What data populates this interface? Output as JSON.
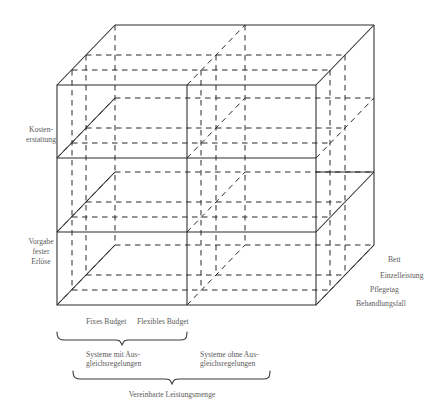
{
  "figure": {
    "type": "3d-cube-taxonomy-diagram",
    "language": "de"
  },
  "axes": {
    "vertical": {
      "name": "verguetungsprinzip",
      "labels": [
        {
          "id": "kostenerstattung",
          "line1": "Kosten-",
          "line2": "erstattung"
        },
        {
          "id": "vorgabe-fester-erloese",
          "line1": "Vorgabe",
          "line2": "fester",
          "line3": "Erlöse"
        }
      ]
    },
    "depth": {
      "name": "bezugsgroesse",
      "labels": [
        {
          "id": "bett",
          "text": "Bett"
        },
        {
          "id": "einzelleistung",
          "text": "Einzelleistung"
        },
        {
          "id": "pflegetag",
          "text": "Pflegetag"
        },
        {
          "id": "behandlungsfall",
          "text": "Behandlungsfall"
        }
      ]
    },
    "horizontal": {
      "name": "budgetform",
      "labels": [
        {
          "id": "fixes-budget",
          "text": "Fixes Budget"
        },
        {
          "id": "flexibles-budget",
          "text": "Flexibles Budget"
        }
      ]
    }
  },
  "braces": {
    "level1": [
      {
        "id": "systeme-mit-ausgleich",
        "line1": "Systeme mit Aus-",
        "line2": "gleichsregelungen"
      },
      {
        "id": "systeme-ohne-ausgleich",
        "line1": "Systeme ohne Aus-",
        "line2": "gleichsregelungen"
      }
    ],
    "level2": [
      {
        "id": "vereinbarte-leistungsmenge",
        "text": "Vereinbarte Leistungsmenge"
      }
    ]
  },
  "colors": {
    "stroke": "#2a2a2a",
    "text": "#5b5b5b",
    "background": "#ffffff"
  }
}
